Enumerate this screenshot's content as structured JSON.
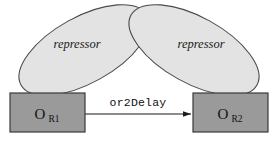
{
  "diagram": {
    "canvas": {
      "width": 278,
      "height": 141,
      "background": "#ffffff"
    },
    "colors": {
      "box_fill": "#9a9a9a",
      "box_stroke": "#3a3a3a",
      "ellipse_fill": "#e3e3e3",
      "ellipse_stroke": "#4a4a4a",
      "edge_stroke": "#1a1a1a",
      "text": "#111111"
    },
    "nodes": [
      {
        "id": "or1",
        "label_main": "O",
        "label_sub": "R1",
        "shape": "rectangle",
        "x": 10,
        "y": 93,
        "width": 75,
        "height": 39
      },
      {
        "id": "or2",
        "label_main": "O",
        "label_sub": "R2",
        "shape": "rectangle",
        "x": 193,
        "y": 93,
        "width": 75,
        "height": 39
      }
    ],
    "ellipses": [
      {
        "id": "repressor-left",
        "label": "repressor",
        "cx": 84,
        "cy": 50,
        "rx": 72,
        "ry": 33,
        "rotation": -29
      },
      {
        "id": "repressor-right",
        "label": "repressor",
        "cx": 194,
        "cy": 50,
        "rx": 72,
        "ry": 33,
        "rotation": 29
      }
    ],
    "edges": [
      {
        "id": "or1-to-or2",
        "label": "or2Delay",
        "from": "or1",
        "to": "or2",
        "x1": 85,
        "y1": 114,
        "x2": 191,
        "y2": 114,
        "arrowhead": "solid-triangle",
        "label_x": 138,
        "label_y": 106
      }
    ]
  }
}
